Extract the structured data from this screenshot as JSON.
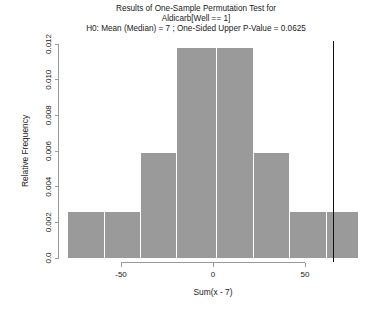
{
  "chart_data": {
    "type": "bar",
    "title": "Results of One-Sample Permutation Test for",
    "subtitle": "Aldicarb[Well == 1]",
    "subtitle2": "H0: Mean (Median) = 7 ;  One-Sided Upper P-Value = 0.0625",
    "xlabel": "Sum(x - 7)",
    "ylabel": "Relative Frequency",
    "xlim": [
      -86,
      84
    ],
    "ylim": [
      0,
      0.0125
    ],
    "grid": false,
    "legend": null,
    "bin_edges": [
      -81,
      -61,
      -41,
      -21,
      1,
      21,
      41,
      61,
      79
    ],
    "categories": [
      "-81 to -61",
      "-61 to -41",
      "-41 to -21",
      "-21 to 1",
      "1 to 21",
      "21 to 41",
      "41 to 61",
      "61 to 79"
    ],
    "values": [
      0.0026,
      0.0026,
      0.0059,
      0.0118,
      0.0118,
      0.0059,
      0.0026,
      0.0026
    ],
    "xticks": [
      -50,
      0,
      50
    ],
    "xticklabels": [
      "-50",
      "0",
      "50"
    ],
    "yticks": [
      0,
      0.002,
      0.004,
      0.006,
      0.008,
      0.01,
      0.012
    ],
    "yticklabels": [
      "0.0",
      "0.002",
      "0.004",
      "0.006",
      "0.008",
      "0.010",
      "0.012"
    ],
    "reference_line": {
      "name": "observed-statistic",
      "x": 65,
      "color": "#111111"
    },
    "bar_color": "#9a9a9a"
  }
}
